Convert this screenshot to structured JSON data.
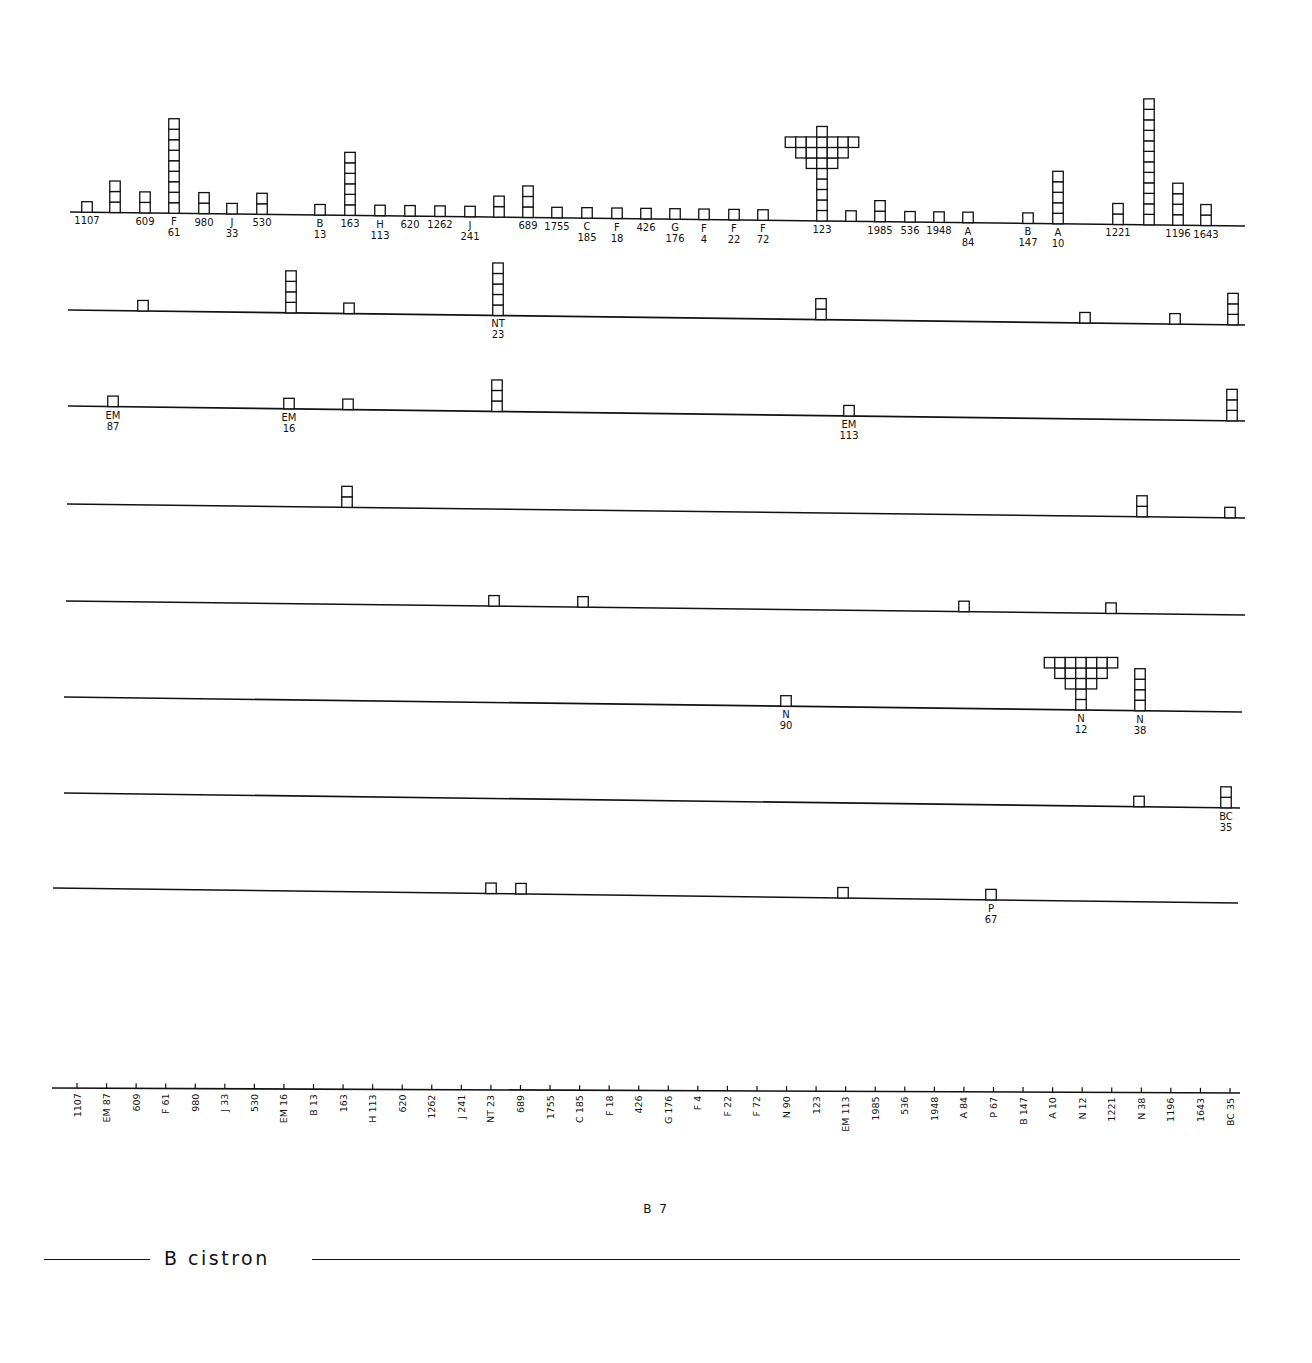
{
  "figure": {
    "title": "B 7",
    "cistron_label": "B cistron"
  },
  "chart_data": {
    "type": "stacked-unit-histogram",
    "title": "B 7",
    "xlabel": "B cistron",
    "axis_sites": [
      "1107",
      "EM 87",
      "609",
      "F 61",
      "980",
      "J 33",
      "530",
      "EM 16",
      "B 13",
      "163",
      "H 113",
      "620",
      "1262",
      "J 241",
      "NT 23",
      "689",
      "1755",
      "C 185",
      "F 18",
      "426",
      "G 176",
      "F 4",
      "F 22",
      "F 72",
      "N 90",
      "123",
      "EM 113",
      "1985",
      "536",
      "1948",
      "A 84",
      "P 67",
      "B 147",
      "A 10",
      "N 12",
      "1221",
      "N 38",
      "1196",
      "1643",
      "BC 35"
    ],
    "rows": [
      {
        "name": "row1",
        "baseline": [
          [
            70,
            212
          ],
          [
            1245,
            226
          ]
        ],
        "stacks": [
          {
            "x": 87,
            "count": 1,
            "label": [
              "1107"
            ]
          },
          {
            "x": 115,
            "count": 3,
            "label": []
          },
          {
            "x": 145,
            "count": 2,
            "label": [
              "609"
            ]
          },
          {
            "x": 174,
            "count": 9,
            "label": [
              "F",
              "61"
            ]
          },
          {
            "x": 204,
            "count": 2,
            "label": [
              "980"
            ]
          },
          {
            "x": 232,
            "count": 1,
            "label": [
              "J",
              "33"
            ]
          },
          {
            "x": 262,
            "count": 2,
            "label": [
              "530"
            ]
          },
          {
            "x": 320,
            "count": 1,
            "label": [
              "B",
              "13"
            ]
          },
          {
            "x": 350,
            "count": 6,
            "label": [
              "163"
            ]
          },
          {
            "x": 380,
            "count": 1,
            "label": [
              "H",
              "113"
            ]
          },
          {
            "x": 410,
            "count": 1,
            "label": [
              "620"
            ]
          },
          {
            "x": 440,
            "count": 1,
            "label": [
              "1262"
            ]
          },
          {
            "x": 470,
            "count": 1,
            "label": [
              "J",
              "241"
            ]
          },
          {
            "x": 499,
            "count": 2,
            "label": []
          },
          {
            "x": 528,
            "count": 3,
            "label": [
              "689"
            ]
          },
          {
            "x": 557,
            "count": 1,
            "label": [
              "1755"
            ]
          },
          {
            "x": 587,
            "count": 1,
            "label": [
              "C",
              "185"
            ]
          },
          {
            "x": 617,
            "count": 1,
            "label": [
              "F",
              "18"
            ]
          },
          {
            "x": 646,
            "count": 1,
            "label": [
              "426"
            ]
          },
          {
            "x": 675,
            "count": 1,
            "label": [
              "G",
              "176"
            ]
          },
          {
            "x": 704,
            "count": 1,
            "label": [
              "F",
              "4"
            ]
          },
          {
            "x": 734,
            "count": 1,
            "label": [
              "F",
              "22"
            ]
          },
          {
            "x": 763,
            "count": 1,
            "label": [
              "F",
              "72"
            ]
          },
          {
            "x": 822,
            "count": 20,
            "label": [
              "123"
            ],
            "overflow_rows": [
              7,
              5,
              3
            ]
          },
          {
            "x": 851,
            "count": 1,
            "label": []
          },
          {
            "x": 880,
            "count": 2,
            "label": [
              "1985"
            ]
          },
          {
            "x": 910,
            "count": 1,
            "label": [
              "536"
            ]
          },
          {
            "x": 939,
            "count": 1,
            "label": [
              "1948"
            ]
          },
          {
            "x": 968,
            "count": 1,
            "label": [
              "A",
              "84"
            ]
          },
          {
            "x": 1028,
            "count": 1,
            "label": [
              "B",
              "147"
            ]
          },
          {
            "x": 1058,
            "count": 5,
            "label": [
              "A",
              "10"
            ]
          },
          {
            "x": 1118,
            "count": 2,
            "label": [
              "1221"
            ]
          },
          {
            "x": 1149,
            "count": 12,
            "label": []
          },
          {
            "x": 1178,
            "count": 4,
            "label": [
              "1196"
            ]
          },
          {
            "x": 1206,
            "count": 2,
            "label": [
              "1643"
            ]
          }
        ]
      },
      {
        "name": "row2",
        "baseline": [
          [
            68,
            310
          ],
          [
            1245,
            325
          ]
        ],
        "stacks": [
          {
            "x": 143,
            "count": 1,
            "label": []
          },
          {
            "x": 291,
            "count": 4,
            "label": []
          },
          {
            "x": 349,
            "count": 1,
            "label": []
          },
          {
            "x": 498,
            "count": 5,
            "label": [
              "NT",
              "23"
            ]
          },
          {
            "x": 821,
            "count": 2,
            "label": []
          },
          {
            "x": 1085,
            "count": 1,
            "label": []
          },
          {
            "x": 1175,
            "count": 1,
            "label": []
          },
          {
            "x": 1233,
            "count": 3,
            "label": []
          }
        ]
      },
      {
        "name": "row3",
        "baseline": [
          [
            68,
            406
          ],
          [
            1245,
            421
          ]
        ],
        "stacks": [
          {
            "x": 113,
            "count": 1,
            "label": [
              "EM",
              "87"
            ]
          },
          {
            "x": 289,
            "count": 1,
            "label": [
              "EM",
              "16"
            ]
          },
          {
            "x": 348,
            "count": 1,
            "label": []
          },
          {
            "x": 497,
            "count": 3,
            "label": []
          },
          {
            "x": 849,
            "count": 1,
            "label": [
              "EM",
              "113"
            ]
          },
          {
            "x": 1232,
            "count": 3,
            "label": []
          }
        ]
      },
      {
        "name": "row4",
        "baseline": [
          [
            67,
            504
          ],
          [
            1245,
            518
          ]
        ],
        "stacks": [
          {
            "x": 347,
            "count": 2,
            "label": []
          },
          {
            "x": 1142,
            "count": 2,
            "label": []
          },
          {
            "x": 1230,
            "count": 1,
            "label": []
          }
        ]
      },
      {
        "name": "row5",
        "baseline": [
          [
            66,
            601
          ],
          [
            1245,
            615
          ]
        ],
        "stacks": [
          {
            "x": 494,
            "count": 1,
            "label": []
          },
          {
            "x": 583,
            "count": 1,
            "label": []
          },
          {
            "x": 964,
            "count": 1,
            "label": []
          },
          {
            "x": 1111,
            "count": 1,
            "label": []
          }
        ]
      },
      {
        "name": "row6",
        "baseline": [
          [
            64,
            697
          ],
          [
            1242,
            712
          ]
        ],
        "stacks": [
          {
            "x": 786,
            "count": 1,
            "label": [
              "N",
              "90"
            ]
          },
          {
            "x": 1081,
            "count": 17,
            "label": [
              "N",
              "12"
            ],
            "overflow_rows": [
              7,
              5,
              3
            ]
          },
          {
            "x": 1140,
            "count": 4,
            "label": [
              "N",
              "38"
            ]
          }
        ]
      },
      {
        "name": "row7",
        "baseline": [
          [
            64,
            793
          ],
          [
            1240,
            808
          ]
        ],
        "stacks": [
          {
            "x": 1139,
            "count": 1,
            "label": []
          },
          {
            "x": 1226,
            "count": 2,
            "label": [
              "BC",
              "35"
            ]
          }
        ]
      },
      {
        "name": "row8",
        "baseline": [
          [
            53,
            888
          ],
          [
            1238,
            903
          ]
        ],
        "stacks": [
          {
            "x": 491,
            "count": 1,
            "label": []
          },
          {
            "x": 521,
            "count": 1,
            "label": []
          },
          {
            "x": 843,
            "count": 1,
            "label": []
          },
          {
            "x": 991,
            "count": 1,
            "label": [
              "P",
              "67"
            ]
          }
        ]
      }
    ],
    "axis": {
      "baseline": [
        [
          52,
          1088
        ],
        [
          1240,
          1093
        ]
      ],
      "tick_x_start": 77,
      "tick_x_end": 1230
    }
  }
}
